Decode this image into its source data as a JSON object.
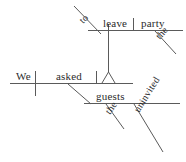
{
  "diagram": {
    "type": "reed-kellogg-sentence-diagram",
    "sentence": "We asked the uninvited guests to leave the party.",
    "stroke_color": "#5a5a5a",
    "text_color": "#2b2b2b",
    "background_color": "#ffffff",
    "words": {
      "subject": "We",
      "verb": "asked",
      "object": "guests",
      "object_article": "the",
      "object_adjective": "uninvited",
      "infinitive_marker": "to",
      "infinitive_verb": "leave",
      "infinitive_object": "party",
      "infinitive_object_article": "the"
    },
    "nodes": [
      {
        "id": "subject",
        "label": "We",
        "role": "subject",
        "baseline": "main",
        "rotated": false
      },
      {
        "id": "verb",
        "label": "asked",
        "role": "verb",
        "baseline": "main",
        "rotated": false
      },
      {
        "id": "object",
        "label": "guests",
        "role": "direct-object",
        "baseline": "object",
        "rotated": false
      },
      {
        "id": "object-article",
        "label": "the",
        "role": "article-modifier",
        "baseline": "object",
        "rotated": true
      },
      {
        "id": "object-adjective",
        "label": "uninvited",
        "role": "adjective-modifier",
        "baseline": "object",
        "rotated": true
      },
      {
        "id": "infinitive-marker",
        "label": "to",
        "role": "infinitive-marker",
        "baseline": "infinitive",
        "rotated": true
      },
      {
        "id": "infinitive-verb",
        "label": "leave",
        "role": "infinitive-verb",
        "baseline": "infinitive",
        "rotated": false
      },
      {
        "id": "infinitive-object",
        "label": "party",
        "role": "infinitive-direct-object",
        "baseline": "infinitive",
        "rotated": false
      },
      {
        "id": "infinitive-object-article",
        "label": "the",
        "role": "article-modifier",
        "baseline": "infinitive",
        "rotated": true
      }
    ]
  }
}
